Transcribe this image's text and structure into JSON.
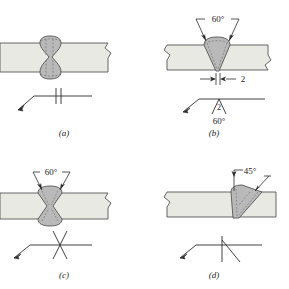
{
  "figure": {
    "colors": {
      "plate_fill": "#e9e9e4",
      "weld_fill": "#b9b9b9",
      "outline": "#555555",
      "symbol_line": "#2b2b2b",
      "text": "#1a1a1a",
      "background": "#ffffff"
    },
    "panels": [
      {
        "id": "a",
        "caption": "(a)",
        "joint_name": "square-groove-butt-joint",
        "weld_shape": "double-square-bead",
        "annotations": [],
        "symbol": {
          "name": "square-groove-weld-symbol",
          "glyph": "two-parallel-vertical-lines",
          "reference_line": true,
          "arrow": true,
          "labels": []
        }
      },
      {
        "id": "b",
        "caption": "(b)",
        "joint_name": "single-v-groove-butt-joint",
        "weld_shape": "single-v-bead",
        "annotations": [
          {
            "name": "groove-angle-label",
            "text": "60°"
          },
          {
            "name": "root-opening-label",
            "text": "2"
          }
        ],
        "symbol": {
          "name": "v-groove-weld-symbol",
          "glyph": "v-shape",
          "reference_line": true,
          "arrow": true,
          "labels": [
            {
              "name": "root-opening-symbol-label",
              "text": "2"
            },
            {
              "name": "groove-angle-symbol-label",
              "text": "60°"
            }
          ]
        }
      },
      {
        "id": "c",
        "caption": "(c)",
        "joint_name": "double-v-groove-butt-joint",
        "weld_shape": "double-v-bead",
        "annotations": [
          {
            "name": "groove-angle-label",
            "text": "60°"
          }
        ],
        "symbol": {
          "name": "double-v-groove-weld-symbol",
          "glyph": "x-shape",
          "reference_line": true,
          "arrow": true,
          "labels": []
        }
      },
      {
        "id": "d",
        "caption": "(d)",
        "joint_name": "single-bevel-groove-butt-joint",
        "weld_shape": "single-bevel-bead",
        "annotations": [
          {
            "name": "bevel-angle-label",
            "text": "45°"
          }
        ],
        "symbol": {
          "name": "bevel-groove-weld-symbol",
          "glyph": "bevel-shape",
          "reference_line": true,
          "arrow": true,
          "labels": []
        }
      }
    ]
  }
}
